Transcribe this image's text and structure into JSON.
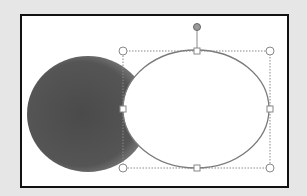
{
  "slide": {
    "background": "#ffffff",
    "border_color": "#111111"
  },
  "shapes": [
    {
      "type": "ellipse",
      "name": "shadow-ellipse",
      "fill": "gradient-dark-gray",
      "selected": false
    },
    {
      "type": "ellipse",
      "name": "white-ellipse",
      "fill": "#ffffff",
      "stroke": "#777777",
      "selected": true
    }
  ],
  "selection": {
    "handles": [
      "top-left",
      "top",
      "top-right",
      "left",
      "right",
      "bottom-left",
      "bottom",
      "bottom-right"
    ],
    "rotation_handle_color": "#8a8a8a"
  }
}
